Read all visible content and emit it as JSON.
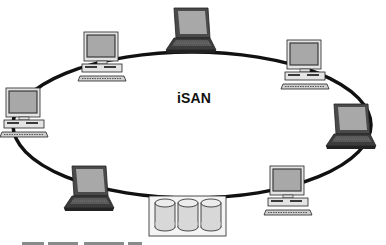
{
  "diagram": {
    "title": "iSAN",
    "topology": "ring",
    "ring": {
      "cx": 192,
      "cy": 125,
      "rx": 179,
      "ry": 73,
      "stroke": "#111111",
      "width": 3.5
    },
    "nodes": [
      {
        "id": "desktop-left",
        "type": "desktop",
        "x": 4,
        "y": 88
      },
      {
        "id": "desktop-upper-left",
        "type": "desktop",
        "x": 82,
        "y": 32
      },
      {
        "id": "laptop-top",
        "type": "laptop",
        "x": 166,
        "y": 8
      },
      {
        "id": "desktop-upper-right",
        "type": "desktop",
        "x": 285,
        "y": 40
      },
      {
        "id": "laptop-right",
        "type": "laptop",
        "x": 326,
        "y": 104
      },
      {
        "id": "desktop-lower-right",
        "type": "desktop",
        "x": 268,
        "y": 166
      },
      {
        "id": "laptop-lower-left",
        "type": "laptop",
        "x": 64,
        "y": 166
      },
      {
        "id": "storage-array",
        "type": "storage",
        "x": 149,
        "y": 196,
        "disks": 3
      }
    ],
    "colors": {
      "screen": "#a8a8a8",
      "body": "#e4e4e4",
      "dark": "#3a3a3a",
      "outline": "#222222",
      "disk": "#d8d8d8"
    }
  },
  "caption": {
    "text": ""
  }
}
